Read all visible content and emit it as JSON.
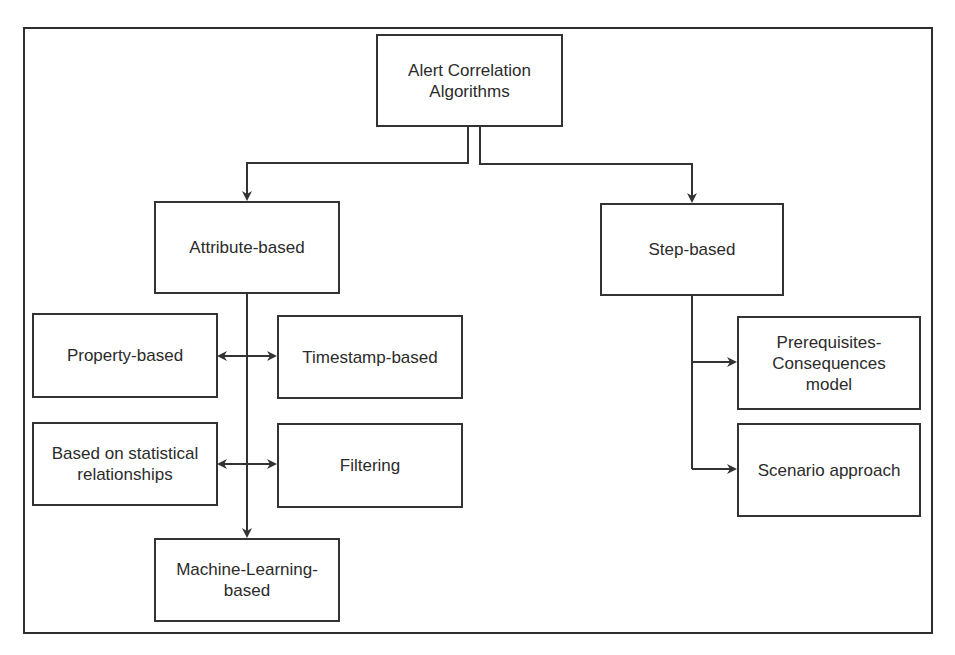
{
  "diagram": {
    "type": "hierarchy",
    "root": {
      "label": "Alert Correlation\nAlgorithms"
    },
    "branches": [
      {
        "label": "Attribute-based",
        "children": [
          {
            "label": "Property-based"
          },
          {
            "label": "Timestamp-based"
          },
          {
            "label": "Based on statistical\nrelationships"
          },
          {
            "label": "Filtering"
          },
          {
            "label": "Machine-Learning-\nbased"
          }
        ]
      },
      {
        "label": "Step-based",
        "children": [
          {
            "label": "Prerequisites-\nConsequences\nmodel"
          },
          {
            "label": "Scenario approach"
          }
        ]
      }
    ],
    "edges": [
      {
        "from": "Alert Correlation Algorithms",
        "to": "Attribute-based",
        "type": "arrow"
      },
      {
        "from": "Alert Correlation Algorithms",
        "to": "Step-based",
        "type": "arrow"
      },
      {
        "from": "Attribute-based",
        "to": "Machine-Learning-based",
        "type": "arrow"
      },
      {
        "from": "Property-based",
        "to": "Timestamp-based",
        "type": "bidirectional"
      },
      {
        "from": "Based on statistical relationships",
        "to": "Filtering",
        "type": "bidirectional"
      },
      {
        "from": "Step-based",
        "to": "Prerequisites-Consequences model",
        "type": "arrow"
      },
      {
        "from": "Step-based",
        "to": "Scenario approach",
        "type": "arrow"
      }
    ],
    "colors": {
      "stroke": "#333333",
      "background": "#ffffff",
      "text": "#2b2b2b"
    }
  }
}
